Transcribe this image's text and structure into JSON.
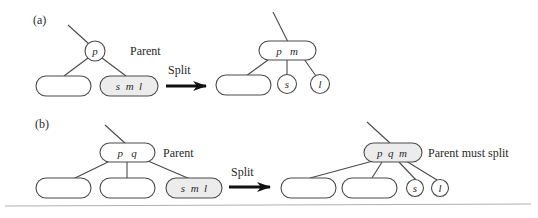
{
  "figure": {
    "panels": [
      {
        "id": "a",
        "label": "(a)",
        "before": {
          "parent_label": "Parent",
          "parent_node": {
            "keys": "p",
            "shape": "circle"
          },
          "children": [
            {
              "keys": "",
              "shape": "rounded-rect",
              "shaded": false
            },
            {
              "keys": "s  m  l",
              "shape": "rounded-rect",
              "shaded": true
            }
          ]
        },
        "transition_label": "Split",
        "after": {
          "parent_node": {
            "keys": "p   m",
            "shape": "rounded-rect",
            "shaded": false
          },
          "children": [
            {
              "keys": "",
              "shape": "rounded-rect"
            },
            {
              "keys": "s",
              "shape": "circle"
            },
            {
              "keys": "l",
              "shape": "circle"
            }
          ]
        }
      },
      {
        "id": "b",
        "label": "(b)",
        "before": {
          "parent_label": "Parent",
          "parent_node": {
            "keys": "p   q",
            "shape": "rounded-rect"
          },
          "children": [
            {
              "keys": "",
              "shape": "rounded-rect",
              "shaded": false
            },
            {
              "keys": "",
              "shape": "rounded-rect",
              "shaded": false
            },
            {
              "keys": "s  m  l",
              "shape": "rounded-rect",
              "shaded": true
            }
          ]
        },
        "transition_label": "Split",
        "after": {
          "parent_label": "Parent must split",
          "parent_node": {
            "keys": "p  q  m",
            "shape": "rounded-rect",
            "shaded": true
          },
          "children": [
            {
              "keys": "",
              "shape": "rounded-rect"
            },
            {
              "keys": "",
              "shape": "rounded-rect"
            },
            {
              "keys": "s",
              "shape": "circle"
            },
            {
              "keys": "l",
              "shape": "circle"
            }
          ]
        }
      }
    ]
  },
  "colors": {
    "stroke": "#4a4a4a",
    "shaded_fill": "#ececec",
    "text": "#2a2a2a",
    "rule": "#b0b0b0"
  }
}
